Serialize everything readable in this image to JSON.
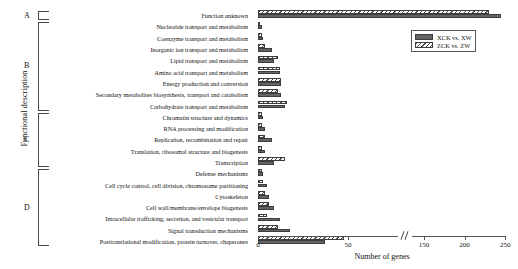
{
  "chart_data": {
    "type": "bar",
    "orientation": "horizontal",
    "title": "",
    "xlabel": "Number of genes",
    "ylabel": "Functional description",
    "xlim": [
      0,
      250
    ],
    "xticks": [
      0,
      50,
      150,
      200,
      250
    ],
    "xtick_labels": [
      "0",
      "50",
      "150",
      "200",
      "250"
    ],
    "axis_break": {
      "present": true,
      "between": [
        50,
        150
      ],
      "marker": "//"
    },
    "grid": false,
    "legend_position": "top-right",
    "categories": [
      "Function unknown",
      "Nucleotide transport and metabolism",
      "Coenzyme transport and metabolism",
      "Inorganic ion transport and metabolism",
      "Lipid transport and metabolism",
      "Amino acid transport and metabolism",
      "Energy production and conversion",
      "Secondary metabolites biosynthesis, transport and catabolism",
      "Carbohydrate transport and metabolism",
      "Chromatin structure and dynamics",
      "RNA processing and modification",
      "Replication, recombination and repair",
      "Translation, ribosomal structure and biogenesis",
      "Transcription",
      "Defense mechanisms",
      "Cell cycle control, cell division, chromosome partitioning",
      "Cytoskeleton",
      "Cell wall/membrane/envelope biogenesis",
      "Intracellular trafficking, secretion, and vesicular transport",
      "Signal transduction mechanisms",
      "Posttranslational modification, protein turnover, chaperones"
    ],
    "series": [
      {
        "name": "XCK vs. XW",
        "color": "#646464",
        "pattern": "solid",
        "values": [
          245,
          2,
          3,
          8,
          9,
          12,
          13,
          13,
          15,
          3,
          4,
          8,
          4,
          9,
          3,
          5,
          6,
          9,
          12,
          18,
          37
        ]
      },
      {
        "name": "ZCK vs. ZW",
        "color": "#4a4a4a",
        "pattern": "diagonal-hatch",
        "values": [
          230,
          1,
          2,
          4,
          11,
          12,
          13,
          11,
          16,
          2,
          2,
          4,
          2,
          15,
          2,
          3,
          4,
          6,
          5,
          11,
          51
        ]
      }
    ],
    "groups": [
      {
        "letter": "A",
        "from": 0,
        "to": 0
      },
      {
        "letter": "B",
        "from": 1,
        "to": 8
      },
      {
        "letter": "C",
        "from": 9,
        "to": 13
      },
      {
        "letter": "D",
        "from": 14,
        "to": 20
      }
    ]
  },
  "legend": {
    "entries": [
      {
        "label": "XCK vs. XW"
      },
      {
        "label": "ZCK vs. ZW"
      }
    ]
  }
}
